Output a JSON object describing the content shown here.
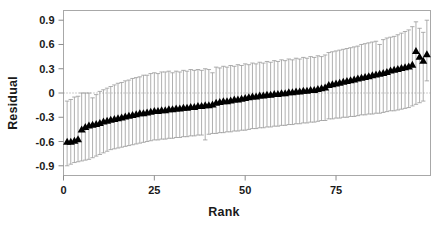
{
  "chart_data": {
    "type": "scatter",
    "title": "",
    "xlabel": "Rank",
    "ylabel": "Residual",
    "xlim": [
      0,
      101
    ],
    "ylim": [
      -1.02,
      1.02
    ],
    "xticks": [
      0,
      25,
      50,
      75
    ],
    "xtick_labels": [
      "0",
      "25",
      "50",
      "75"
    ],
    "yticks": [
      0.9,
      0.6,
      0.3,
      0,
      -0.3,
      -0.6,
      -0.9
    ],
    "ytick_labels": [
      "0.9",
      "0.6",
      "0.3",
      "0",
      "-0.3",
      "-0.6",
      "-0.9"
    ],
    "grid": false,
    "zero_reference_line": 0,
    "marker": "triangle-up-filled",
    "marker_color": "#000000",
    "errorbar_color": "#9a9a9a",
    "frame_color": "#a8a8a8",
    "series": [
      {
        "name": "Residual",
        "x": [
          1,
          2,
          3,
          4,
          5,
          6,
          7,
          8,
          9,
          10,
          11,
          12,
          13,
          14,
          15,
          16,
          17,
          18,
          19,
          20,
          21,
          22,
          23,
          24,
          25,
          26,
          27,
          28,
          29,
          30,
          31,
          32,
          33,
          34,
          35,
          36,
          37,
          38,
          39,
          40,
          41,
          42,
          43,
          44,
          45,
          46,
          47,
          48,
          49,
          50,
          51,
          52,
          53,
          54,
          55,
          56,
          57,
          58,
          59,
          60,
          61,
          62,
          63,
          64,
          65,
          66,
          67,
          68,
          69,
          70,
          71,
          72,
          73,
          74,
          75,
          76,
          77,
          78,
          79,
          80,
          81,
          82,
          83,
          84,
          85,
          86,
          87,
          88,
          89,
          90,
          91,
          92,
          93,
          94,
          95,
          96,
          97,
          98,
          99,
          100
        ],
        "values": [
          -0.6,
          -0.6,
          -0.59,
          -0.57,
          -0.45,
          -0.42,
          -0.4,
          -0.39,
          -0.38,
          -0.37,
          -0.35,
          -0.34,
          -0.33,
          -0.32,
          -0.31,
          -0.3,
          -0.29,
          -0.28,
          -0.27,
          -0.26,
          -0.25,
          -0.25,
          -0.24,
          -0.23,
          -0.22,
          -0.22,
          -0.21,
          -0.21,
          -0.2,
          -0.2,
          -0.19,
          -0.19,
          -0.18,
          -0.18,
          -0.17,
          -0.17,
          -0.16,
          -0.16,
          -0.15,
          -0.15,
          -0.14,
          -0.12,
          -0.11,
          -0.1,
          -0.1,
          -0.09,
          -0.08,
          -0.08,
          -0.07,
          -0.06,
          -0.05,
          -0.04,
          -0.04,
          -0.03,
          -0.03,
          -0.02,
          -0.02,
          -0.01,
          -0.01,
          0.0,
          0.0,
          0.01,
          0.01,
          0.02,
          0.02,
          0.03,
          0.03,
          0.04,
          0.04,
          0.05,
          0.06,
          0.07,
          0.1,
          0.11,
          0.12,
          0.13,
          0.14,
          0.15,
          0.16,
          0.17,
          0.18,
          0.19,
          0.2,
          0.21,
          0.22,
          0.23,
          0.24,
          0.25,
          0.26,
          0.28,
          0.29,
          0.3,
          0.31,
          0.32,
          0.33,
          0.35,
          0.52,
          0.45,
          0.4,
          0.48
        ],
        "error_upper": [
          -0.1,
          -0.08,
          -0.05,
          -0.04,
          0.0,
          0.0,
          0.0,
          -0.06,
          -0.02,
          0.02,
          0.04,
          0.06,
          0.08,
          0.1,
          0.12,
          0.13,
          0.15,
          0.16,
          0.18,
          0.19,
          0.2,
          0.22,
          0.22,
          0.24,
          0.25,
          0.24,
          0.26,
          0.26,
          0.27,
          0.25,
          0.27,
          0.26,
          0.28,
          0.27,
          0.29,
          0.28,
          0.29,
          0.28,
          0.3,
          0.29,
          0.25,
          0.32,
          0.31,
          0.33,
          0.32,
          0.34,
          0.33,
          0.35,
          0.34,
          0.36,
          0.35,
          0.37,
          0.36,
          0.38,
          0.37,
          0.39,
          0.38,
          0.4,
          0.39,
          0.41,
          0.4,
          0.42,
          0.41,
          0.43,
          0.42,
          0.44,
          0.43,
          0.45,
          0.44,
          0.46,
          0.45,
          0.47,
          0.5,
          0.51,
          0.52,
          0.53,
          0.54,
          0.55,
          0.56,
          0.57,
          0.58,
          0.6,
          0.61,
          0.62,
          0.63,
          0.64,
          0.6,
          0.66,
          0.68,
          0.69,
          0.7,
          0.72,
          0.74,
          0.76,
          0.78,
          0.82,
          0.88,
          0.8,
          0.75,
          0.9
        ],
        "error_lower": [
          -0.9,
          -0.88,
          -0.86,
          -0.85,
          -0.84,
          -0.83,
          -0.82,
          -0.8,
          -0.78,
          -0.76,
          -0.74,
          -0.72,
          -0.7,
          -0.69,
          -0.68,
          -0.67,
          -0.66,
          -0.65,
          -0.64,
          -0.63,
          -0.62,
          -0.61,
          -0.6,
          -0.59,
          -0.58,
          -0.58,
          -0.57,
          -0.57,
          -0.56,
          -0.56,
          -0.55,
          -0.55,
          -0.54,
          -0.54,
          -0.53,
          -0.53,
          -0.52,
          -0.52,
          -0.58,
          -0.51,
          -0.5,
          -0.5,
          -0.49,
          -0.49,
          -0.48,
          -0.48,
          -0.47,
          -0.47,
          -0.46,
          -0.46,
          -0.45,
          -0.44,
          -0.44,
          -0.43,
          -0.43,
          -0.42,
          -0.42,
          -0.41,
          -0.41,
          -0.4,
          -0.4,
          -0.39,
          -0.39,
          -0.38,
          -0.38,
          -0.37,
          -0.37,
          -0.36,
          -0.36,
          -0.35,
          -0.34,
          -0.34,
          -0.32,
          -0.32,
          -0.31,
          -0.31,
          -0.3,
          -0.3,
          -0.29,
          -0.29,
          -0.28,
          -0.27,
          -0.27,
          -0.26,
          -0.26,
          -0.25,
          -0.25,
          -0.24,
          -0.23,
          -0.22,
          -0.22,
          -0.21,
          -0.2,
          -0.19,
          -0.18,
          -0.16,
          -0.14,
          -0.12,
          -0.1,
          0.15
        ]
      }
    ]
  }
}
